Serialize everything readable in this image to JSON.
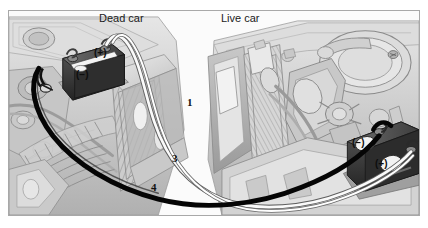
{
  "figure": {
    "background_color": "#ffffff",
    "frame_border_color": "#a8a8a8"
  },
  "labels": {
    "dead_car": "Dead car",
    "live_car": "Live car"
  },
  "callouts": [
    {
      "id": "callout-1",
      "text": "1"
    },
    {
      "id": "callout-3",
      "text": "3"
    },
    {
      "id": "callout-4",
      "text": "4"
    }
  ],
  "dead_car_battery": {
    "positive_terminal": "(+)",
    "negative_terminal": "(−)"
  },
  "live_car_battery": {
    "negative_terminal": "(−)",
    "positive_terminal": "(+)"
  },
  "cables": {
    "positive_cable_color": "#f2f2f2",
    "negative_cable_color": "#0a0a0a"
  },
  "palette": {
    "ink": "#111111",
    "engine_light": "#dcdcdc",
    "engine_mid": "#b6b6b6",
    "engine_dark": "#8e8e8e",
    "battery_case": "#3a3a3a",
    "body_panel": "#cfcfcf"
  }
}
